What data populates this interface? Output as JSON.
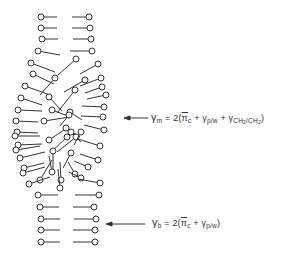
{
  "diagram": {
    "stroke_color": "#333333",
    "head_radius": 3,
    "ordered_top_rows": [
      {
        "y": 17,
        "left": [
          41,
          57
        ],
        "right": [
          72,
          89
        ]
      },
      {
        "y": 28,
        "left": [
          41,
          57
        ],
        "right": [
          72,
          90
        ]
      },
      {
        "y": 39,
        "left": [
          42,
          58
        ],
        "right": [
          73,
          91
        ]
      },
      {
        "y": 51,
        "left": [
          38,
          60,
          55
        ],
        "right": [
          70,
          92
        ]
      }
    ],
    "disordered_chains": [
      {
        "x1": 31,
        "y1": 63,
        "x2": 55,
        "y2": 72
      },
      {
        "x1": 76,
        "y1": 59,
        "x2": 58,
        "y2": 75
      },
      {
        "x1": 98,
        "y1": 64,
        "x2": 80,
        "y2": 74
      },
      {
        "x1": 33,
        "y1": 74,
        "x2": 54,
        "y2": 84
      },
      {
        "x1": 55,
        "y1": 78,
        "x2": 40,
        "y2": 95
      },
      {
        "x1": 85,
        "y1": 80,
        "x2": 64,
        "y2": 92
      },
      {
        "x1": 101,
        "y1": 78,
        "x2": 80,
        "y2": 86
      },
      {
        "x1": 25,
        "y1": 86,
        "x2": 50,
        "y2": 95
      },
      {
        "x1": 75,
        "y1": 90,
        "x2": 57,
        "y2": 113
      },
      {
        "x1": 102,
        "y1": 87,
        "x2": 85,
        "y2": 93
      },
      {
        "x1": 21,
        "y1": 98,
        "x2": 42,
        "y2": 105
      },
      {
        "x1": 49,
        "y1": 97,
        "x2": 62,
        "y2": 111
      },
      {
        "x1": 106,
        "y1": 95,
        "x2": 87,
        "y2": 99
      },
      {
        "x1": 18,
        "y1": 110,
        "x2": 42,
        "y2": 111
      },
      {
        "x1": 52,
        "y1": 110,
        "x2": 68,
        "y2": 116
      },
      {
        "x1": 70,
        "y1": 112,
        "x2": 82,
        "y2": 120
      },
      {
        "x1": 104,
        "y1": 107,
        "x2": 82,
        "y2": 106
      },
      {
        "x1": 16,
        "y1": 121,
        "x2": 38,
        "y2": 122
      },
      {
        "x1": 103,
        "y1": 117,
        "x2": 81,
        "y2": 116
      },
      {
        "x1": 44,
        "y1": 121,
        "x2": 70,
        "y2": 117
      },
      {
        "x1": 69,
        "y1": 115,
        "x2": 60,
        "y2": 126
      },
      {
        "x1": 17,
        "y1": 132,
        "x2": 38,
        "y2": 133
      },
      {
        "x1": 66,
        "y1": 128,
        "x2": 80,
        "y2": 137
      },
      {
        "x1": 104,
        "y1": 130,
        "x2": 84,
        "y2": 125
      },
      {
        "x1": 15,
        "y1": 136,
        "x2": 40,
        "y2": 136
      },
      {
        "x1": 49,
        "y1": 140,
        "x2": 64,
        "y2": 130
      },
      {
        "x1": 71,
        "y1": 132,
        "x2": 81,
        "y2": 142
      },
      {
        "x1": 18,
        "y1": 145,
        "x2": 42,
        "y2": 144
      },
      {
        "x1": 67,
        "y1": 137,
        "x2": 50,
        "y2": 153
      },
      {
        "x1": 76,
        "y1": 137,
        "x2": 57,
        "y2": 152
      },
      {
        "x1": 100,
        "y1": 146,
        "x2": 78,
        "y2": 139
      },
      {
        "x1": 16,
        "y1": 150,
        "x2": 40,
        "y2": 146
      },
      {
        "x1": 81,
        "y1": 132,
        "x2": 74,
        "y2": 145
      },
      {
        "x1": 98,
        "y1": 160,
        "x2": 80,
        "y2": 154
      },
      {
        "x1": 20,
        "y1": 158,
        "x2": 45,
        "y2": 152
      },
      {
        "x1": 53,
        "y1": 151,
        "x2": 53,
        "y2": 175
      },
      {
        "x1": 71,
        "y1": 153,
        "x2": 63,
        "y2": 168
      },
      {
        "x1": 88,
        "y1": 167,
        "x2": 74,
        "y2": 161
      },
      {
        "x1": 24,
        "y1": 168,
        "x2": 44,
        "y2": 163
      },
      {
        "x1": 40,
        "y1": 180,
        "x2": 52,
        "y2": 160
      },
      {
        "x1": 61,
        "y1": 180,
        "x2": 60,
        "y2": 162
      },
      {
        "x1": 75,
        "y1": 174,
        "x2": 68,
        "y2": 162
      },
      {
        "x1": 23,
        "y1": 173,
        "x2": 45,
        "y2": 167
      },
      {
        "x1": 52,
        "y1": 172,
        "x2": 49,
        "y2": 156
      },
      {
        "x1": 81,
        "y1": 178,
        "x2": 69,
        "y2": 172
      },
      {
        "x1": 29,
        "y1": 184,
        "x2": 50,
        "y2": 177
      },
      {
        "x1": 100,
        "y1": 183,
        "x2": 78,
        "y2": 179
      },
      {
        "x1": 60,
        "y1": 188,
        "x2": 58,
        "y2": 169
      }
    ],
    "ordered_bottom_rows": [
      {
        "y": 195,
        "left": [
          38,
          58
        ],
        "right": [
          75,
          99
        ]
      },
      {
        "y": 207,
        "left": [
          40,
          59
        ],
        "right": [
          73,
          94
        ]
      },
      {
        "y": 219,
        "left": [
          41,
          60
        ],
        "right": [
          74,
          96
        ]
      },
      {
        "y": 230,
        "left": [
          41,
          60
        ],
        "right": [
          73,
          95
        ]
      },
      {
        "y": 242,
        "left": [
          41,
          60
        ],
        "right": [
          73,
          95
        ]
      }
    ],
    "arrows": [
      {
        "name": "membrane-middle-arrow",
        "x1": 148,
        "x2": 124,
        "y": 118
      },
      {
        "name": "membrane-bottom-arrow",
        "x1": 145,
        "x2": 106,
        "y": 224
      }
    ],
    "equations": {
      "gamma_m": {
        "lhs_symbol": "γ",
        "lhs_sub": "m",
        "equals": "= 2(",
        "term1": "π",
        "term1_sub": "c",
        "plus1": " + ",
        "term2": "γ",
        "term2_sub": "p/w",
        "plus2": " + ",
        "term3": "γ",
        "term3_sub_a": "CH",
        "term3_sub_a_sub": "2",
        "term3_sub_b": "/CH",
        "term3_sub_b_sub": "2",
        "close": ")"
      },
      "gamma_b": {
        "lhs_symbol": "γ",
        "lhs_sub": "b",
        "equals": "= 2(",
        "term1": "π",
        "term1_sub": "c",
        "plus1": " + ",
        "term2": "γ",
        "term2_sub": "p/w",
        "close": ")"
      }
    }
  }
}
